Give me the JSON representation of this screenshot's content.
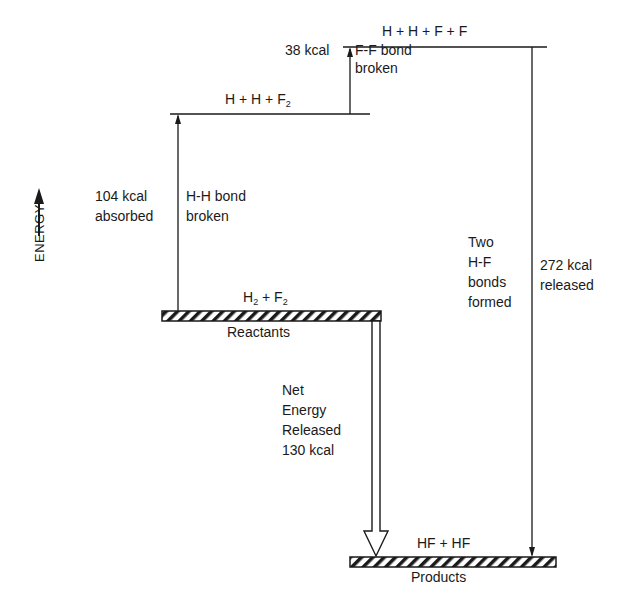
{
  "diagram": {
    "axis_label": "ENERGY",
    "levels": {
      "atoms": {
        "label": "H + H + F + F"
      },
      "intermediate": {
        "label_main": "H + H + F",
        "label_sub": "2"
      },
      "reactants": {
        "label_h": "H",
        "label_h_sub": "2",
        "label_plus": " + F",
        "label_f_sub": "2",
        "caption": "Reactants"
      },
      "products": {
        "label": "HF + HF",
        "caption": "Products"
      }
    },
    "steps": {
      "hh_break": {
        "amount_line1": "104 kcal",
        "amount_line2": "absorbed",
        "desc_line1": "H-H bond",
        "desc_line2": "broken"
      },
      "ff_break": {
        "amount": "38 kcal",
        "desc_line1": "F-F bond",
        "desc_line2": "broken"
      },
      "hf_form": {
        "desc_line1": "Two",
        "desc_line2": "H-F",
        "desc_line3": "bonds",
        "desc_line4": "formed",
        "amount_line1": "272 kcal",
        "amount_line2": "released"
      },
      "net": {
        "line1": "Net",
        "line2": "Energy",
        "line3": "Released",
        "line4": "130 kcal"
      }
    }
  }
}
